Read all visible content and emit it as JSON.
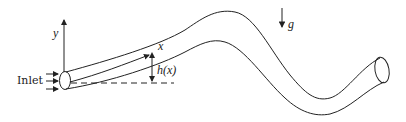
{
  "diagram": {
    "type": "pipe-flow-schematic",
    "labels": {
      "inlet": "Inlet",
      "y_axis": "y",
      "x_coord": "x",
      "height": "h(x)",
      "gravity": "g"
    },
    "colors": {
      "line": "#222222",
      "background": "#ffffff"
    },
    "elements": [
      {
        "name": "inlet-flow-arrows",
        "count": 3
      },
      {
        "name": "inlet-opening",
        "shape": "ellipse"
      },
      {
        "name": "pipe-body",
        "shape": "curved-tube"
      },
      {
        "name": "outlet-opening",
        "shape": "ellipse"
      },
      {
        "name": "y-axis-arrow",
        "direction": "up"
      },
      {
        "name": "centerline-arrow",
        "label_ref": "x_coord"
      },
      {
        "name": "reference-datum-line",
        "style": "dashed"
      },
      {
        "name": "height-dimension-arrow",
        "label_ref": "height"
      },
      {
        "name": "gravity-arrow",
        "direction": "down",
        "label_ref": "gravity"
      }
    ]
  }
}
